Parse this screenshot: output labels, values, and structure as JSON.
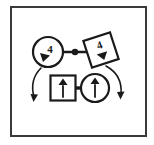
{
  "figure": {
    "type": "node-link-diagram",
    "canvas": {
      "width": 154,
      "height": 145
    },
    "colors": {
      "ink": "#1a1a1a",
      "background": "#ffffff",
      "frame": "#3a3a3a"
    },
    "frame": {
      "label": "outer-border-box",
      "x": 11,
      "y": 7,
      "width": 135,
      "height": 129,
      "stroke_width": 2
    },
    "nodes": [
      {
        "id": "node-top-left",
        "shape": "circle",
        "label": "4",
        "glyph": "triangle-down-left",
        "cx": 48,
        "cy": 52,
        "r": 15,
        "rotation": 0
      },
      {
        "id": "node-top-right",
        "shape": "square",
        "label": "4",
        "glyph": "triangle-down",
        "cx": 101,
        "cy": 50,
        "size": 28,
        "rotation": -18
      },
      {
        "id": "node-bottom-left",
        "shape": "square",
        "label": "",
        "glyph": "arrow-up",
        "cx": 63,
        "cy": 88,
        "size": 25,
        "rotation": 0
      },
      {
        "id": "node-bottom-right",
        "shape": "circle",
        "label": "",
        "glyph": "arrow-up",
        "cx": 95,
        "cy": 88,
        "r": 14,
        "rotation": 0
      }
    ],
    "edges": [
      {
        "id": "edge-top-link",
        "from": "node-top-left",
        "to": "node-top-right",
        "style": "straight-with-midpoint-dot",
        "has_dot": true
      },
      {
        "id": "edge-bottom-link",
        "from": "node-bottom-left",
        "to": "node-bottom-right",
        "style": "straight-thick",
        "has_dot": false
      },
      {
        "id": "edge-left-curve",
        "from": "node-top-left",
        "to": "free-end-left",
        "style": "curved-arrow",
        "arrowhead": "down"
      },
      {
        "id": "edge-right-curve",
        "from": "node-top-right",
        "to": "free-end-right",
        "style": "curved-arrow",
        "arrowhead": "down"
      }
    ],
    "legend": []
  }
}
